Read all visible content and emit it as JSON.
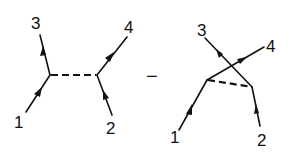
{
  "figure": {
    "operator": "−",
    "colors": {
      "ink": "#111111",
      "background": "#ffffff"
    },
    "diagrams": [
      {
        "name": "s-channel-exchange",
        "labels": {
          "p1": "1",
          "p2": "2",
          "p3": "3",
          "p4": "4"
        },
        "propagator": "dashed"
      },
      {
        "name": "crossed-exchange",
        "labels": {
          "p1": "1",
          "p2": "2",
          "p3": "3",
          "p4": "4"
        },
        "propagator": "dashed"
      }
    ]
  }
}
